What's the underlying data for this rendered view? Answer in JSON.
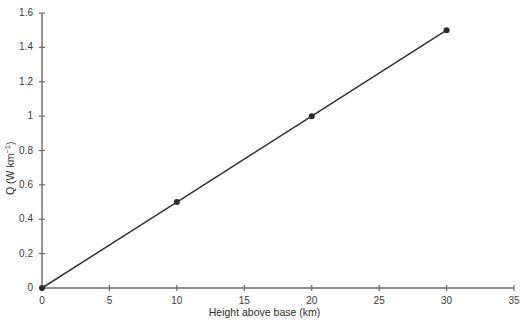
{
  "chart_data": {
    "type": "line",
    "title": "",
    "subtitle": "",
    "xlabel": "Height above base (km)",
    "ylabel_text": "Q (W km",
    "ylabel_exponent": "−1",
    "ylabel_tail": ")",
    "ylabel_full": "Q (W km−1)",
    "x": [
      0,
      10,
      20,
      30
    ],
    "values": [
      0,
      0.5,
      1.0,
      1.5
    ],
    "series": [
      {
        "name": "Q",
        "x": [
          0,
          10,
          20,
          30
        ],
        "values": [
          0,
          0.5,
          1.0,
          1.5
        ],
        "marker": "filled-circle",
        "line_color": "#333333",
        "marker_color": "#2b2b2b"
      }
    ],
    "xlim": [
      0,
      35
    ],
    "ylim": [
      0,
      1.6
    ],
    "xticks": [
      0,
      5,
      10,
      15,
      20,
      25,
      30,
      35
    ],
    "xtick_labels": [
      "0",
      "5",
      "10",
      "15",
      "20",
      "25",
      "30",
      "35"
    ],
    "yticks": [
      0,
      0.2,
      0.4,
      0.6,
      0.8,
      1.0,
      1.2,
      1.4,
      1.6
    ],
    "ytick_labels": [
      "0",
      "0.2",
      "0.4",
      "0.6",
      "0.8",
      "1",
      "1.2",
      "1.4",
      "1.6"
    ],
    "grid": false,
    "legend": null,
    "legend_position": "none",
    "annotations": [],
    "axis_color": "#6b6b6b",
    "text_color": "#3b3b3b",
    "background": "#ffffff",
    "slope": 0.05,
    "intercept": 0
  },
  "axes": {
    "x_axis_name": "x-axis",
    "y_axis_name": "y-axis"
  }
}
